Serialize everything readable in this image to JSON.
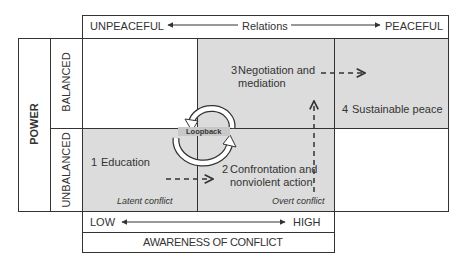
{
  "relations_axis": {
    "left_label": "UNPEACEFUL",
    "center_label": "Relations",
    "right_label": "PEACEFUL"
  },
  "power_axis": {
    "title": "POWER",
    "top_label": "BALANCED",
    "bottom_label": "UNBALANCED"
  },
  "awareness_axis": {
    "low_label": "LOW",
    "high_label": "HIGH",
    "title": "AWARENESS OF CONFLICT"
  },
  "stages": [
    {
      "number": "1",
      "label": "Education"
    },
    {
      "number": "2",
      "label_line1": "Confrontation and",
      "label_line2": "nonviolent action"
    },
    {
      "number": "3",
      "label_line1": "Negotiation and",
      "label_line2": "mediation"
    },
    {
      "number": "4",
      "label": "Sustainable peace"
    }
  ],
  "annotations": {
    "latent": "Latent conflict",
    "overt": "Overt conflict",
    "loopback": "Loopback"
  },
  "colors": {
    "shade": "#dcdcdc",
    "line": "#333333"
  }
}
